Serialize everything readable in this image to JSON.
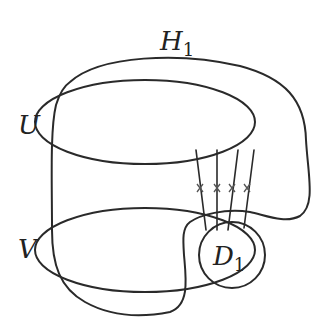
{
  "diagram": {
    "type": "topology-diagram",
    "labels": {
      "H": {
        "main": "H",
        "sub": "1"
      },
      "U": "U",
      "V": "V",
      "D": {
        "main": "D",
        "sub": "1"
      }
    },
    "elements": [
      {
        "id": "outer-curve-H1",
        "description": "closed curve H1 enclosing U and V, passing through D1 region"
      },
      {
        "id": "ellipse-U",
        "description": "upper ellipse U"
      },
      {
        "id": "ellipse-V",
        "description": "lower ellipse V"
      },
      {
        "id": "disk-D1",
        "description": "circle D1 inside lower-right of V"
      },
      {
        "id": "connecting-arcs",
        "count": 4,
        "description": "four arcs from U to D1, each marked with a cross"
      }
    ],
    "colors": {
      "stroke": "#2a2a2a",
      "background": "#ffffff"
    }
  }
}
